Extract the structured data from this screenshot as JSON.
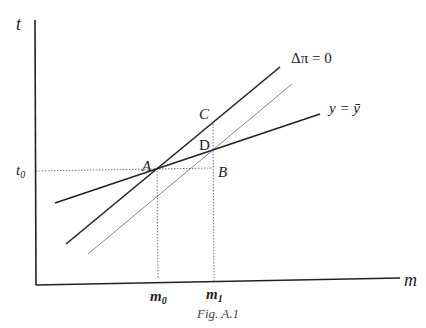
{
  "figure": {
    "caption": "Fig. A.1",
    "header_fragment": "...appropriate"
  },
  "axes": {
    "y_label": "t",
    "x_label": "m",
    "y_tick": {
      "base": "t",
      "sub": "0"
    },
    "x_ticks": [
      {
        "base": "m",
        "sub": "0"
      },
      {
        "base": "m",
        "sub": "1"
      }
    ]
  },
  "curves": {
    "dpi_zero": "Δπ = 0",
    "y_bar": "y = ȳ"
  },
  "points": {
    "A": "A",
    "B": "B",
    "C": "C",
    "D": "D"
  },
  "colors": {
    "line": "#222222",
    "thin_line": "#777777",
    "dotted": "#555555"
  }
}
